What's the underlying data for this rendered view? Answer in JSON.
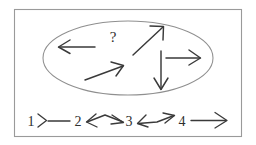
{
  "figure": {
    "frame": {
      "stroke_color": "#9a9a9a",
      "x": 14,
      "y": 9,
      "width": 228,
      "height": 128
    },
    "ellipse": {
      "name": "disordered-region",
      "stroke_color": "#8f8f8f",
      "cx": 128,
      "cy": 58,
      "rx": 85,
      "ry": 37
    },
    "question_mark": {
      "label": "?",
      "x": 113,
      "y": 42
    },
    "scattered_arrows": [
      {
        "name": "arrow-left",
        "direction": "left",
        "x1": 95,
        "y1": 47,
        "x2": 59,
        "y2": 47
      },
      {
        "name": "arrow-up-right-upper",
        "direction": "up-right",
        "x1": 133,
        "y1": 55,
        "x2": 163,
        "y2": 27
      },
      {
        "name": "arrow-up-right-lower",
        "direction": "up-right",
        "x1": 85,
        "y1": 80,
        "x2": 123,
        "y2": 66
      },
      {
        "name": "arrow-right",
        "direction": "right",
        "x1": 166,
        "y1": 58,
        "x2": 200,
        "y2": 58
      },
      {
        "name": "arrow-down",
        "direction": "down",
        "x1": 161,
        "y1": 51,
        "x2": 161,
        "y2": 89
      }
    ],
    "sequence_row": {
      "name": "ordered-sequence",
      "baseline_y": 124,
      "items": [
        {
          "label": "1",
          "x": 31
        },
        {
          "label": "2",
          "x": 78
        },
        {
          "label": "3",
          "x": 129
        },
        {
          "label": "4",
          "x": 180
        }
      ],
      "connectors": [
        {
          "name": "connector-1-to-2",
          "style": "right-arrow-then-line",
          "x1": 41,
          "x2": 72,
          "y": 120
        },
        {
          "name": "connector-2-to-3",
          "style": "left-head-peak-right-head",
          "x1": 88,
          "x2": 122,
          "y": 120
        },
        {
          "name": "connector-3-to-4",
          "style": "left-head-dip-right-head",
          "x1": 139,
          "x2": 173,
          "y": 120
        },
        {
          "name": "connector-4-to-end",
          "style": "plain-right-arrow",
          "x1": 190,
          "x2": 228,
          "y": 120
        }
      ]
    },
    "colors": {
      "ink": "#3a3a3a",
      "frame": "#9a9a9a",
      "ellipse": "#8f8f8f",
      "background": "#ffffff"
    }
  }
}
